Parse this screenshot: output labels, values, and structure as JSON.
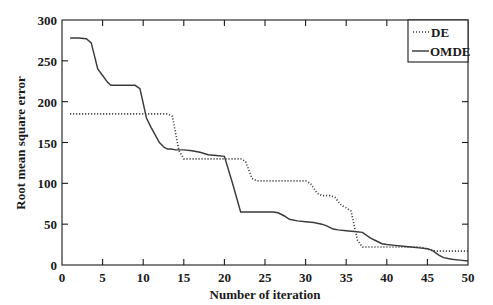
{
  "chart_data": {
    "type": "line",
    "title": "",
    "xlabel": "Number of iteration",
    "ylabel": "Root mean square error",
    "xlim": [
      0,
      50
    ],
    "ylim": [
      0,
      300
    ],
    "xticks": [
      0,
      5,
      10,
      15,
      20,
      25,
      30,
      35,
      40,
      45,
      50
    ],
    "xtick_labels": [
      "0",
      "5",
      "10",
      "15",
      "20",
      "25",
      "30",
      "35",
      "40",
      "45",
      "50"
    ],
    "yticks": [
      0,
      50,
      100,
      150,
      200,
      250,
      300
    ],
    "ytick_labels": [
      "0",
      "50",
      "100",
      "150",
      "200",
      "250",
      "300"
    ],
    "grid": false,
    "legend_position": "top-right",
    "series": [
      {
        "name": "DE",
        "style": "dotted",
        "color": "#3a3a3a",
        "x": [
          1,
          2,
          3,
          4,
          5,
          6,
          7,
          8,
          9,
          10,
          11,
          12,
          13,
          13.6,
          14.4,
          15,
          16,
          17,
          18,
          19,
          20,
          21,
          22,
          22.6,
          23.4,
          24,
          25,
          26,
          27,
          28,
          29,
          30,
          30.6,
          31.4,
          32,
          33,
          33.6,
          34.4,
          35,
          35.6,
          36.4,
          37,
          38,
          39,
          40,
          41,
          42,
          43,
          44,
          44.6,
          45.4,
          46,
          47,
          48,
          49,
          50
        ],
        "y": [
          185,
          185,
          185,
          185,
          185,
          185,
          185,
          185,
          185,
          185,
          185,
          185,
          185,
          182,
          140,
          130,
          130,
          130,
          130,
          130,
          130,
          130,
          130,
          127,
          106,
          103,
          103,
          103,
          103,
          103,
          103,
          103,
          100,
          88,
          85,
          85,
          83,
          73,
          70,
          66,
          30,
          22,
          22,
          22,
          22,
          22,
          22,
          22,
          22,
          21,
          18,
          17,
          17,
          17,
          17,
          17
        ]
      },
      {
        "name": "OMDE",
        "style": "solid",
        "color": "#3a3a3a",
        "x": [
          1,
          2,
          3,
          3.6,
          4.4,
          5,
          5.6,
          6,
          7,
          8,
          9,
          9.6,
          10.4,
          11,
          12,
          12.6,
          13,
          13.4,
          14,
          15,
          16,
          17,
          18,
          19,
          20,
          21,
          22,
          23,
          24,
          25,
          26,
          26.6,
          27.4,
          28,
          29,
          30,
          31,
          32,
          32.6,
          33.4,
          34,
          35,
          36,
          37,
          38,
          38.6,
          39.4,
          40,
          41,
          42,
          43,
          44,
          45,
          45.6,
          46.4,
          47,
          48,
          49,
          50
        ],
        "y": [
          278,
          278,
          277,
          272,
          240,
          232,
          224,
          220,
          220,
          220,
          220,
          216,
          180,
          168,
          150,
          144,
          142,
          142,
          141,
          141,
          140,
          138,
          135,
          134,
          133,
          100,
          65,
          65,
          65,
          65,
          65,
          64,
          60,
          56,
          54,
          53,
          52,
          50,
          48,
          44,
          43,
          42,
          41,
          40,
          33,
          30,
          26,
          25,
          24,
          23,
          22,
          21,
          20,
          18,
          12,
          9,
          7,
          6,
          5
        ]
      }
    ],
    "legend_entries": [
      {
        "label": "DE",
        "style": "dotted"
      },
      {
        "label": "OMDE",
        "style": "solid"
      }
    ]
  }
}
